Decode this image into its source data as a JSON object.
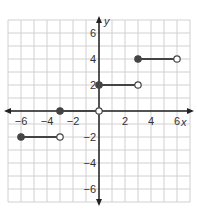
{
  "chart_data": {
    "type": "line",
    "title": "",
    "xlabel": "x",
    "ylabel": "y",
    "xlim": [
      -7,
      7
    ],
    "ylim": [
      -7,
      7
    ],
    "grid": true,
    "x_ticks": [
      -6,
      -4,
      -2,
      2,
      4,
      6
    ],
    "y_ticks": [
      6,
      4,
      2,
      -2,
      -4,
      -6
    ],
    "x_tick_labels": [
      "−6",
      "−4",
      "−2",
      "2",
      "4",
      "6"
    ],
    "y_tick_labels": [
      "6",
      "4",
      "2",
      "−2",
      "−4",
      "−6"
    ],
    "series": [
      {
        "name": "step-1",
        "x": [
          -6,
          -3
        ],
        "y": [
          -2,
          -2
        ],
        "start": "closed",
        "end": "open"
      },
      {
        "name": "step-2",
        "x": [
          -3,
          0
        ],
        "y": [
          0,
          0
        ],
        "start": "closed",
        "end": "open"
      },
      {
        "name": "step-3",
        "x": [
          0,
          3
        ],
        "y": [
          2,
          2
        ],
        "start": "closed",
        "end": "open"
      },
      {
        "name": "step-4",
        "x": [
          3,
          6
        ],
        "y": [
          4,
          4
        ],
        "start": "closed",
        "end": "open"
      }
    ],
    "colors": {
      "grid": "#d0d0d0",
      "axis": "#222222",
      "segment": "#444444",
      "point_fill": "#444444",
      "open_fill": "#ffffff"
    }
  }
}
